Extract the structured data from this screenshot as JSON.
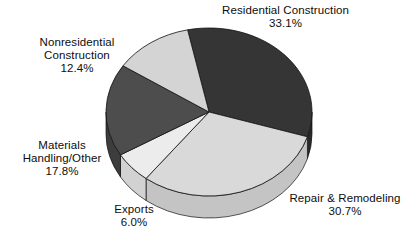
{
  "chart_data": {
    "type": "pie",
    "title": "",
    "subtitle": "",
    "xlabel": "",
    "ylabel": "",
    "legend_position": "none",
    "grid": false,
    "three_d": true,
    "value_unit": "%",
    "total": 100.0,
    "categories": [
      "Residential Construction",
      "Repair & Remodeling",
      "Exports",
      "Materials Handling/Other",
      "Nonresidential Construction"
    ],
    "values": [
      33.1,
      30.7,
      6.0,
      17.8,
      12.4
    ],
    "colors": [
      "#353535",
      "#d9d9d9",
      "#ececec",
      "#4d4d4d",
      "#d4d4d4"
    ],
    "slices": [
      {
        "label": "Residential Construction",
        "value": 33.1,
        "value_text": "33.1%",
        "color": "#353535",
        "side_color": "#2a2a2a"
      },
      {
        "label": "Repair & Remodeling",
        "value": 30.7,
        "value_text": "30.7%",
        "color": "#d9d9d9",
        "side_color": "#c4c4c4"
      },
      {
        "label": "Exports",
        "value": 6.0,
        "value_text": "6.0%",
        "color": "#ececec",
        "side_color": "#d2d2d2"
      },
      {
        "label": "Materials Handling/Other",
        "value": 17.8,
        "value_text": "17.8%",
        "color": "#4d4d4d",
        "side_color": "#3d3d3d"
      },
      {
        "label": "Nonresidential Construction",
        "value": 12.4,
        "value_text": "12.4%",
        "color": "#d4d4d4",
        "side_color": "#bdbdbd"
      }
    ]
  },
  "labels": {
    "residential": {
      "line1": "Residential Construction",
      "line2": "33.1%"
    },
    "nonresidential": {
      "line1": "Nonresidential",
      "line2": "Construction",
      "line3": "12.4%"
    },
    "materials": {
      "line1": "Materials",
      "line2": "Handling/Other",
      "line3": "17.8%"
    },
    "exports": {
      "line1": "Exports",
      "line2": "6.0%"
    },
    "repair": {
      "line1": "Repair & Remodeling",
      "line2": "30.7%"
    }
  }
}
